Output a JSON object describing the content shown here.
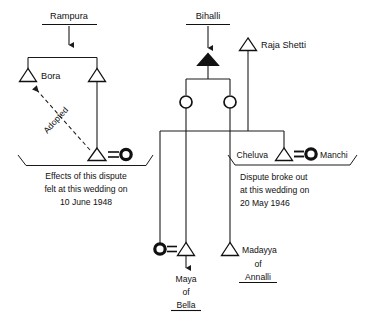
{
  "figure": {
    "type": "kinship-genealogy-diagram",
    "background_color": "#ffffff",
    "line_color": "#1a1a1a"
  },
  "left_group": {
    "village_label": "Rampura",
    "person_bora": "Bora",
    "adoption_label": "Adopted",
    "caption_line1": "Effects of this dispute",
    "caption_line2": "felt at this wedding on",
    "caption_line3": "10 June 1948"
  },
  "right_group": {
    "village_label": "Bihalli",
    "person_raja_shetti": "Raja Shetti",
    "person_cheluva": "Cheluva",
    "person_manchi": "Manchi",
    "caption_line1": "Dispute broke out",
    "caption_line2": "at this wedding on",
    "caption_line3": "20 May 1946"
  },
  "bottom_group": {
    "maya_name": "Maya",
    "maya_of": "of",
    "maya_place": "Bella",
    "madayya_name": "Madayya",
    "madayya_of": "of",
    "madayya_place": "Annalli"
  },
  "symbols": {
    "male_open": "open-triangle",
    "male_filled": "filled-triangle",
    "female_open": "open-circle",
    "female_filled": "filled-circle",
    "marriage": "equals-sign",
    "descent": "down-arrow",
    "adoption": "dashed-arrow"
  }
}
